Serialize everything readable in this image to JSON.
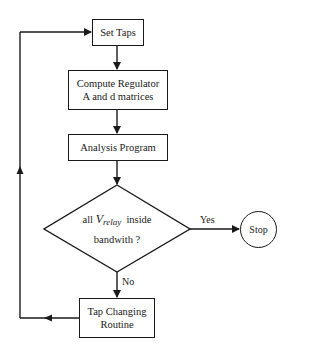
{
  "diagram": {
    "type": "flowchart",
    "nodes": {
      "set_taps": {
        "label": "Set Taps"
      },
      "compute": {
        "line1": "Compute Regulator",
        "line2": "A and d matrices"
      },
      "analysis": {
        "label": "Analysis Program"
      },
      "decision": {
        "prefix": "all",
        "var": "V",
        "var_sub": "relay",
        "suffix": "inside",
        "line2": "bandwith ?"
      },
      "stop": {
        "label": "Stop"
      },
      "tap_changing": {
        "line1": "Tap Changing",
        "line2": "Routine"
      }
    },
    "edges": {
      "yes_label": "Yes",
      "no_label": "No"
    },
    "colors": {
      "stroke": "#1a1a1a",
      "background": "#ffffff"
    }
  }
}
